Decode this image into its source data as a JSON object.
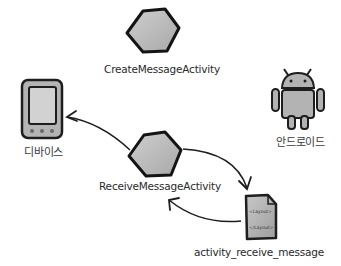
{
  "diagram": {
    "nodes": [
      {
        "id": "create_activity",
        "label": "CreateMessageActivity",
        "icon": "hexagon-activity-icon"
      },
      {
        "id": "receive_activity",
        "label": "ReceiveMessageActivity",
        "icon": "hexagon-activity-icon"
      },
      {
        "id": "device",
        "label": "디바이스",
        "icon": "phone-device-icon"
      },
      {
        "id": "android",
        "label": "안드로이드",
        "icon": "android-robot-icon"
      },
      {
        "id": "layout",
        "label": "activity_receive_message",
        "icon": "layout-file-icon",
        "file_lines": [
          "<Layout>",
          "</Layout>"
        ]
      }
    ],
    "edges": [
      {
        "from": "receive_activity",
        "to": "device"
      },
      {
        "from": "receive_activity",
        "to": "layout"
      },
      {
        "from": "layout",
        "to": "receive_activity"
      }
    ],
    "colors": {
      "fill": "#b9b9b9",
      "stroke": "#1a1a1a",
      "background": "#ffffff"
    }
  }
}
